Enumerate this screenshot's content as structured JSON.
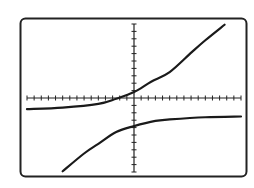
{
  "chart_data": {
    "type": "line",
    "title": "",
    "xlabel": "",
    "ylabel": "",
    "xlim": [
      -15,
      15
    ],
    "ylim": [
      -10,
      10
    ],
    "xscl": 1,
    "yscl": 1,
    "grid": false,
    "legend": "none",
    "colors": {
      "background": "#ffffff",
      "frame": "#222222",
      "axes": "#222222",
      "curve": "#1a1a1a"
    },
    "series": [
      {
        "name": "upper-branch",
        "x": [
          -15,
          -10,
          -5,
          -2.5,
          0,
          2.4,
          5,
          8.1,
          10,
          12.7
        ],
        "y": [
          -1.5,
          -1.3,
          -0.8,
          -0.1,
          0.8,
          2.2,
          3.5,
          6.2,
          7.8,
          9.9
        ]
      },
      {
        "name": "lower-branch",
        "x": [
          -10,
          -7,
          -5,
          -2.5,
          0,
          3,
          5,
          10,
          15
        ],
        "y": [
          -9.9,
          -7.5,
          -6.2,
          -4.6,
          -3.8,
          -3.1,
          -2.9,
          -2.6,
          -2.5
        ]
      }
    ]
  }
}
